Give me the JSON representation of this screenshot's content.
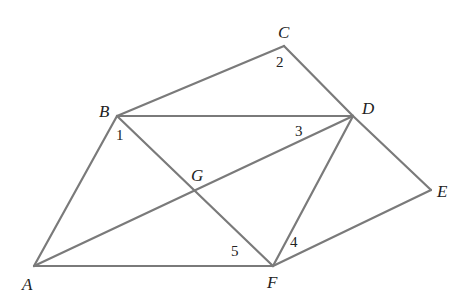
{
  "diagram": {
    "colors": {
      "line": "#7a7a7a",
      "text": "#222222",
      "background": "#ffffff"
    },
    "points": {
      "A": {
        "label": "A",
        "x": 34,
        "y": 266
      },
      "B": {
        "label": "B",
        "x": 117,
        "y": 116
      },
      "C": {
        "label": "C",
        "x": 284,
        "y": 46
      },
      "D": {
        "label": "D",
        "x": 353,
        "y": 116
      },
      "E": {
        "label": "E",
        "x": 431,
        "y": 190
      },
      "F": {
        "label": "F",
        "x": 273,
        "y": 266
      },
      "G": {
        "label": "G",
        "x": 195,
        "y": 191
      }
    },
    "segments": [
      [
        "A",
        "B"
      ],
      [
        "B",
        "C"
      ],
      [
        "C",
        "D"
      ],
      [
        "B",
        "D"
      ],
      [
        "D",
        "E"
      ],
      [
        "E",
        "F"
      ],
      [
        "A",
        "F"
      ],
      [
        "A",
        "D"
      ],
      [
        "B",
        "F"
      ],
      [
        "D",
        "F"
      ]
    ],
    "angle_labels": {
      "a1": {
        "label": "1",
        "x": 116,
        "y": 140
      },
      "a2": {
        "label": "2",
        "x": 276,
        "y": 67
      },
      "a3": {
        "label": "3",
        "x": 295,
        "y": 136
      },
      "a4": {
        "label": "4",
        "x": 290,
        "y": 247
      },
      "a5": {
        "label": "5",
        "x": 231,
        "y": 256
      }
    }
  }
}
